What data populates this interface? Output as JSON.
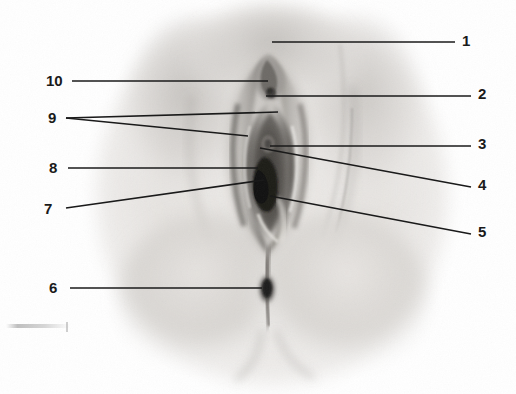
{
  "figure": {
    "kind": "anatomical-photograph-with-numbered-leader-lines",
    "width": 516,
    "height": 394,
    "background_color": "#ffffff",
    "ink_color": "#1a1a1a",
    "label_count": 10
  },
  "labels": {
    "right": [
      {
        "id": "1",
        "text": "1",
        "x": 462,
        "y": 33,
        "line": {
          "x1": 272,
          "y1": 42,
          "x2": 455,
          "y2": 42
        }
      },
      {
        "id": "2",
        "text": "2",
        "x": 478,
        "y": 86,
        "line": {
          "x1": 266,
          "y1": 96,
          "x2": 471,
          "y2": 96
        }
      },
      {
        "id": "3",
        "text": "3",
        "x": 478,
        "y": 136,
        "line": {
          "x1": 270,
          "y1": 146,
          "x2": 471,
          "y2": 146
        }
      },
      {
        "id": "4",
        "text": "4",
        "x": 478,
        "y": 177,
        "line": {
          "x1": 260,
          "y1": 148,
          "x2": 471,
          "y2": 187
        }
      },
      {
        "id": "5",
        "text": "5",
        "x": 478,
        "y": 224,
        "line": {
          "x1": 270,
          "y1": 196,
          "x2": 471,
          "y2": 234
        }
      }
    ],
    "left": [
      {
        "id": "10",
        "text": "10",
        "x": 46,
        "y": 73,
        "line": {
          "x1": 72,
          "y1": 81,
          "x2": 268,
          "y2": 81
        }
      },
      {
        "id": "9a",
        "text": "9",
        "x": 48,
        "y": 112,
        "line": {
          "x1": 66,
          "y1": 118,
          "x2": 278,
          "y2": 112
        }
      },
      {
        "id": "9b",
        "text": "",
        "x": 0,
        "y": 0,
        "line": {
          "x1": 66,
          "y1": 118,
          "x2": 248,
          "y2": 136
        }
      },
      {
        "id": "8",
        "text": "8",
        "x": 48,
        "y": 160,
        "line": {
          "x1": 68,
          "y1": 168,
          "x2": 258,
          "y2": 168
        }
      },
      {
        "id": "7",
        "text": "7",
        "x": 43,
        "y": 201,
        "line": {
          "x1": 66,
          "y1": 208,
          "x2": 264,
          "y2": 180
        }
      },
      {
        "id": "6",
        "text": "6",
        "x": 48,
        "y": 280,
        "line": {
          "x1": 70,
          "y1": 288,
          "x2": 262,
          "y2": 288
        }
      }
    ]
  },
  "photo": {
    "tone_light": "#f2f1ef",
    "tone_mid": "#d8d6d3",
    "tone_shadow": "#a9a6a2",
    "tone_dark": "#6e6b67",
    "tone_darkest": "#232323",
    "plate_left": 110,
    "plate_right": 436,
    "plate_top": 4,
    "plate_bottom": 380
  }
}
